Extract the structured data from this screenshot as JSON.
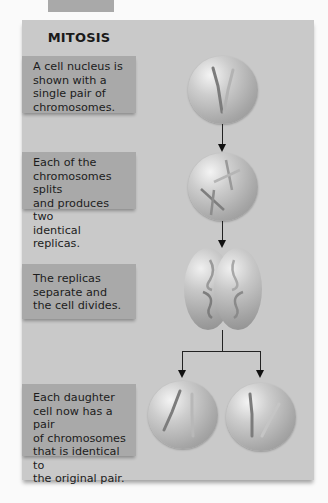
{
  "figure": {
    "title": "MITOSIS",
    "steps": [
      {
        "text": "A cell nucleus is\nshown with a\nsingle pair of\nchromosomes.",
        "image": "cell-with-chromosome-pair"
      },
      {
        "text": "Each of the\nchromosomes splits\nand produces two\nidentical replicas.",
        "image": "cell-with-replicated-chromosomes"
      },
      {
        "text": "The replicas\nseparate and\nthe cell divides.",
        "image": "dividing-cell"
      },
      {
        "text": "Each daughter\ncell now has a pair\nof chromosomes\nthat is identical to\nthe original pair.",
        "image": "two-daughter-cells"
      }
    ]
  },
  "colors": {
    "panel_background": "#c9c9c9",
    "text_box_background": "#a9a9a9",
    "arrow": "#222222"
  }
}
